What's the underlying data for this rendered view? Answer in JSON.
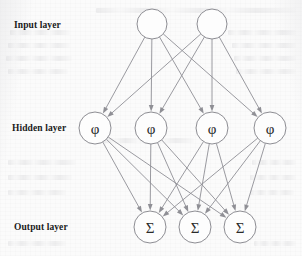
{
  "figure": {
    "type": "neural-network-diagram",
    "title": "",
    "background_color": "#fcfcfc",
    "node_stroke_color": "#8d8d93",
    "edge_color": "#8f8f95",
    "label_color": "#1b1b1b"
  },
  "labels": {
    "input": "Input layer",
    "hidden": "Hidden layer",
    "output": "Output layer"
  },
  "label_positions": [
    {
      "key": "input",
      "x": 14,
      "y": 20
    },
    {
      "key": "hidden",
      "x": 12,
      "y": 123
    },
    {
      "key": "output",
      "x": 14,
      "y": 222
    }
  ],
  "layers": [
    {
      "name": "Input layer",
      "id": "input",
      "count": 2,
      "glyph": "",
      "radius": 15,
      "y": 24,
      "nodes": [
        {
          "id": "i1",
          "label": "",
          "x": 152,
          "y": 24
        },
        {
          "id": "i2",
          "label": "",
          "x": 212,
          "y": 24
        }
      ]
    },
    {
      "name": "Hidden layer",
      "id": "hidden",
      "count": 4,
      "glyph": "φ",
      "radius": 16,
      "y": 128,
      "nodes": [
        {
          "id": "h1",
          "label": "φ",
          "x": 95,
          "y": 128
        },
        {
          "id": "h2",
          "label": "φ",
          "x": 151,
          "y": 128
        },
        {
          "id": "h3",
          "label": "φ",
          "x": 212,
          "y": 128
        },
        {
          "id": "h4",
          "label": "φ",
          "x": 270,
          "y": 128
        }
      ]
    },
    {
      "name": "Output layer",
      "id": "output",
      "count": 3,
      "glyph": "Σ",
      "radius": 16,
      "y": 227,
      "nodes": [
        {
          "id": "o1",
          "label": "Σ",
          "x": 150,
          "y": 227
        },
        {
          "id": "o2",
          "label": "Σ",
          "x": 195,
          "y": 227
        },
        {
          "id": "o3",
          "label": "Σ",
          "x": 240,
          "y": 227
        }
      ]
    }
  ],
  "connections": {
    "input_to_hidden": [
      [
        "i1",
        "h1"
      ],
      [
        "i1",
        "h2"
      ],
      [
        "i1",
        "h3"
      ],
      [
        "i1",
        "h4"
      ],
      [
        "i2",
        "h1"
      ],
      [
        "i2",
        "h2"
      ],
      [
        "i2",
        "h3"
      ],
      [
        "i2",
        "h4"
      ]
    ],
    "hidden_to_output": [
      [
        "h1",
        "o1"
      ],
      [
        "h1",
        "o2"
      ],
      [
        "h1",
        "o3"
      ],
      [
        "h2",
        "o1"
      ],
      [
        "h2",
        "o2"
      ],
      [
        "h2",
        "o3"
      ],
      [
        "h3",
        "o1"
      ],
      [
        "h3",
        "o2"
      ],
      [
        "h3",
        "o3"
      ],
      [
        "h4",
        "o1"
      ],
      [
        "h4",
        "o2"
      ],
      [
        "h4",
        "o3"
      ]
    ],
    "directed": true,
    "arrowhead": "triangle"
  },
  "ghost_text_lines": [
    {
      "x": 96,
      "y": 8,
      "w": 200
    },
    {
      "x": 10,
      "y": 30,
      "w": 60
    },
    {
      "x": 228,
      "y": 30,
      "w": 68
    },
    {
      "x": 8,
      "y": 43,
      "w": 62
    },
    {
      "x": 232,
      "y": 43,
      "w": 64
    },
    {
      "x": 6,
      "y": 56,
      "w": 66
    },
    {
      "x": 234,
      "y": 56,
      "w": 62
    },
    {
      "x": 8,
      "y": 69,
      "w": 60
    },
    {
      "x": 236,
      "y": 69,
      "w": 60
    },
    {
      "x": 104,
      "y": 138,
      "w": 90
    },
    {
      "x": 8,
      "y": 160,
      "w": 68
    },
    {
      "x": 8,
      "y": 175,
      "w": 64
    },
    {
      "x": 8,
      "y": 190,
      "w": 58
    },
    {
      "x": 252,
      "y": 160,
      "w": 44
    },
    {
      "x": 250,
      "y": 175,
      "w": 46
    },
    {
      "x": 250,
      "y": 190,
      "w": 44
    },
    {
      "x": 8,
      "y": 241,
      "w": 58
    },
    {
      "x": 254,
      "y": 241,
      "w": 42
    }
  ]
}
